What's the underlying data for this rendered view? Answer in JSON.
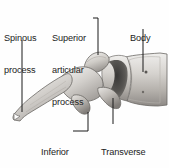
{
  "figure": {
    "view": "lateral",
    "background_color": "#fefefe",
    "text_color": "#232323",
    "leader_line_color": "#1a1a1a",
    "bone_colors": {
      "light": "#f2f1ef",
      "mid": "#c9c6c2",
      "shadow": "#8f8b87",
      "dark": "#4a4846",
      "outline": "#5c5a57"
    }
  },
  "labels": {
    "spinous": {
      "line1": "Spinous",
      "line2": "process"
    },
    "superior": {
      "line1": "Superior",
      "line2": "articular",
      "line3": "process"
    },
    "body": {
      "line1": "Body"
    },
    "inferior": {
      "line1": "Inferior",
      "line2": "articular",
      "line3": "process"
    },
    "transverse": {
      "line1": "Transverse",
      "line2": "process"
    }
  }
}
